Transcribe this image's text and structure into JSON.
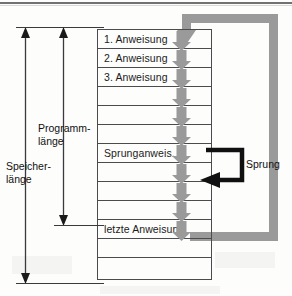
{
  "figure": {
    "type": "memory-layout-diagram",
    "language": "de",
    "background_color": "#fdfdfc",
    "line_color": "#4b4b4d",
    "accent_gray": "#9a9a9a",
    "accent_black": "#101010"
  },
  "table": {
    "total_rows": 13,
    "row_height": 19,
    "rows": [
      {
        "index": 0,
        "label": "1. Anweisung",
        "has_label": true
      },
      {
        "index": 1,
        "label": "2. Anweisung",
        "has_label": true
      },
      {
        "index": 2,
        "label": "3. Anweisung",
        "has_label": true
      },
      {
        "index": 3,
        "label": "",
        "has_label": false
      },
      {
        "index": 4,
        "label": "",
        "has_label": false
      },
      {
        "index": 5,
        "label": "",
        "has_label": false
      },
      {
        "index": 6,
        "label": "Sprunganweis.",
        "has_label": true
      },
      {
        "index": 7,
        "label": "",
        "has_label": false
      },
      {
        "index": 8,
        "label": "",
        "has_label": false
      },
      {
        "index": 9,
        "label": "",
        "has_label": false
      },
      {
        "index": 10,
        "label": "letzte Anweisung",
        "has_label": true
      },
      {
        "index": 11,
        "label": "",
        "has_label": false
      },
      {
        "index": 12,
        "label": "",
        "has_label": false
      }
    ]
  },
  "sequence_arrows": {
    "count": 11,
    "color": "#9a9a9a",
    "direction": "down"
  },
  "loop": {
    "name": "program-restart-loop",
    "color": "#9a9a9a",
    "direction": "up-right-across-top-down-into-first-instruction"
  },
  "jump": {
    "label": "Sprung",
    "color": "#101010",
    "from_row": 6,
    "to_row": 9
  },
  "measures": [
    {
      "id": "programmlaenge",
      "line1": "Programm-",
      "line2": "länge",
      "spans_rows": "0-10"
    },
    {
      "id": "speicherlaenge",
      "line1": "Speicher-",
      "line2": "länge",
      "spans_rows": "0-12"
    }
  ]
}
